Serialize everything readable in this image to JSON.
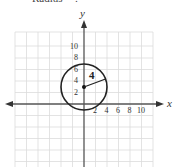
{
  "caption": "Radius = ?",
  "graph": {
    "x_axis_label": "x",
    "y_axis_label": "y",
    "x_ticks": [
      "2",
      "4",
      "6",
      "8",
      "10"
    ],
    "y_ticks": [
      "10",
      "8",
      "6",
      "4",
      "2"
    ],
    "radius_label": "4",
    "circle": {
      "center": [
        0,
        3
      ],
      "radius": 4
    },
    "colors": {
      "grid": "#d8d8d8",
      "axis": "#555555",
      "circle": "#222222"
    }
  }
}
